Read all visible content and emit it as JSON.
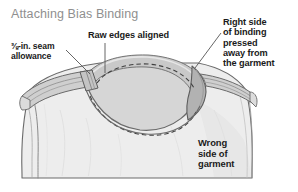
{
  "title": {
    "text": "Attaching Bias Binding",
    "color": "#8f8f8f"
  },
  "labels": {
    "seam_allowance": "⅜-in. seam\nallowance",
    "raw_edges": "Raw edges aligned",
    "right_side_binding": "Right side\nof binding\npressed\naway from\nthe garment",
    "wrong_side_garment": "Wrong\nside of\ngarment"
  },
  "illustration": {
    "name": "garment-neckline-bias-binding-diagram",
    "colors": {
      "garment_body": "#ededed",
      "garment_body_shade": "#e2e2e2",
      "binding_light": "#d4d4d4",
      "binding_mid": "#c3c3c3",
      "binding_dark": "#ababab",
      "outline": "#5d5d5d",
      "stitch_dash": "#4a4a4a",
      "leader_line": "#555555",
      "background": "#ffffff"
    },
    "leader_lines": [
      {
        "name": "leader-seam-allowance",
        "x1": 66,
        "y1": 50,
        "x2": 90,
        "y2": 74
      },
      {
        "name": "leader-raw-edges",
        "x1": 105,
        "y1": 43,
        "x2": 105,
        "y2": 73
      },
      {
        "name": "leader-right-side",
        "x1": 221,
        "y1": 33,
        "x2": 195,
        "y2": 68
      }
    ],
    "stitch_lines": [
      {
        "name": "stitch-line-upper-neckline"
      },
      {
        "name": "stitch-line-lower-neckline"
      }
    ]
  }
}
